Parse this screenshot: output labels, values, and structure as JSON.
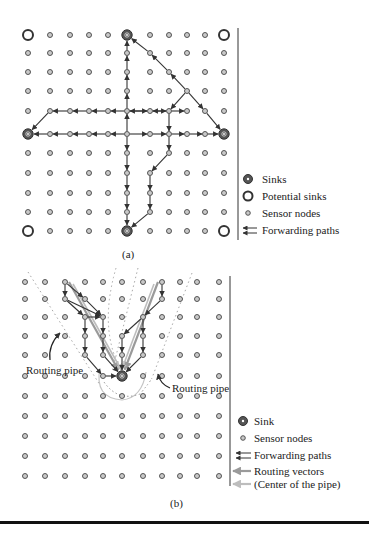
{
  "colors": {
    "node_fill": "#c9c9c9",
    "node_stroke": "#444444",
    "sink_fill": "#555555",
    "path": "#333333",
    "routing_vector": "#9a9a9a",
    "pipe_center": "#bdbdbd",
    "pipe_dotted": "#9a9a9a"
  },
  "panel_a": {
    "caption": "(a)",
    "grid": {
      "cols": [
        28,
        50,
        70,
        89,
        108,
        127,
        150,
        169,
        187,
        205,
        224
      ],
      "rows": [
        35,
        53,
        72,
        91,
        111,
        134,
        153,
        173,
        193,
        212,
        231
      ]
    },
    "sinks": [
      [
        5,
        0
      ],
      [
        0,
        5
      ],
      [
        10,
        5
      ],
      [
        5,
        10
      ]
    ],
    "potential_sinks": [
      [
        0,
        0
      ],
      [
        10,
        0
      ],
      [
        0,
        10
      ],
      [
        10,
        10
      ]
    ],
    "paths": [
      [
        [
          5,
          5
        ],
        [
          5,
          4
        ],
        [
          5,
          3
        ],
        [
          5,
          2
        ],
        [
          5,
          1
        ],
        [
          5,
          0
        ]
      ],
      [
        [
          5,
          5
        ],
        [
          5,
          6
        ],
        [
          5,
          7
        ],
        [
          5,
          8
        ],
        [
          5,
          9
        ],
        [
          5,
          10
        ]
      ],
      [
        [
          5,
          5
        ],
        [
          4,
          5
        ],
        [
          3,
          5
        ],
        [
          2,
          5
        ],
        [
          1,
          5
        ],
        [
          0,
          5
        ]
      ],
      [
        [
          5,
          5
        ],
        [
          6,
          5
        ],
        [
          7,
          5
        ],
        [
          8,
          5
        ],
        [
          9,
          5
        ],
        [
          10,
          5
        ]
      ],
      [
        [
          5,
          4
        ],
        [
          6,
          4
        ],
        [
          7,
          4
        ],
        [
          8,
          4
        ]
      ],
      [
        [
          7,
          4
        ],
        [
          6,
          4
        ],
        [
          5,
          4
        ],
        [
          4,
          4
        ],
        [
          3,
          4
        ],
        [
          2,
          4
        ],
        [
          1,
          4
        ],
        [
          0,
          5
        ]
      ],
      [
        [
          8,
          3
        ],
        [
          7,
          4
        ],
        [
          7,
          5
        ],
        [
          7,
          6
        ],
        [
          6,
          7
        ],
        [
          6,
          8
        ],
        [
          6,
          9
        ],
        [
          5,
          10
        ]
      ],
      [
        [
          8,
          3
        ],
        [
          9,
          4
        ],
        [
          10,
          5
        ]
      ],
      [
        [
          8,
          3
        ],
        [
          7,
          2
        ],
        [
          6,
          1
        ],
        [
          5,
          0
        ]
      ]
    ],
    "legend": {
      "divider_x": 238,
      "items": [
        {
          "icon": "sink-icon",
          "label": "Sinks"
        },
        {
          "icon": "potential-sink-icon",
          "label": "Potential sinks"
        },
        {
          "icon": "sensor-node-icon",
          "label": "Sensor nodes"
        },
        {
          "icon": "forwarding-paths-icon",
          "label": "Forwarding paths"
        }
      ]
    }
  },
  "panel_b": {
    "caption": "(b)",
    "grid": {
      "cols": [
        25,
        45,
        65,
        85,
        103,
        122,
        143,
        162,
        180,
        197,
        219
      ],
      "rows": [
        282,
        299,
        317,
        336,
        355,
        376,
        396,
        416,
        436,
        456,
        476
      ]
    },
    "sinks": [
      [
        5,
        5
      ]
    ],
    "paths": [
      [
        [
          2,
          0
        ],
        [
          2,
          1
        ],
        [
          4,
          2
        ],
        [
          4,
          3
        ],
        [
          4,
          4
        ],
        [
          5,
          5
        ]
      ],
      [
        [
          2,
          0
        ],
        [
          3,
          1
        ],
        [
          4,
          2
        ]
      ],
      [
        [
          2,
          1
        ],
        [
          3,
          2
        ],
        [
          3,
          3
        ],
        [
          3,
          4
        ],
        [
          4,
          5
        ],
        [
          5,
          5
        ]
      ],
      [
        [
          3,
          2
        ],
        [
          4,
          2
        ]
      ],
      [
        [
          7,
          0
        ],
        [
          7,
          1
        ],
        [
          6,
          2
        ],
        [
          6,
          3
        ],
        [
          6,
          4
        ],
        [
          5,
          5
        ]
      ],
      [
        [
          6,
          2
        ],
        [
          5,
          3
        ],
        [
          5,
          4
        ],
        [
          5,
          5
        ]
      ]
    ],
    "routing_vectors": [
      [
        [
          2,
          0
        ],
        [
          5,
          5
        ]
      ],
      [
        [
          7,
          0
        ],
        [
          5,
          5
        ]
      ]
    ],
    "annotations": [
      {
        "text": "Routing pipe",
        "x": 26,
        "y": 374
      },
      {
        "text": "Routing pipe",
        "x": 172,
        "y": 392
      }
    ],
    "legend": {
      "divider_x": 230,
      "items": [
        {
          "icon": "sink-icon",
          "label": "Sink"
        },
        {
          "icon": "sensor-node-icon",
          "label": "Sensor nodes"
        },
        {
          "icon": "forwarding-paths-icon",
          "label": "Forwarding paths"
        },
        {
          "icon": "routing-vectors-icon",
          "label": "Routing vectors"
        },
        {
          "icon": "pipe-center-icon",
          "label": "(Center of the pipe)"
        }
      ]
    }
  }
}
